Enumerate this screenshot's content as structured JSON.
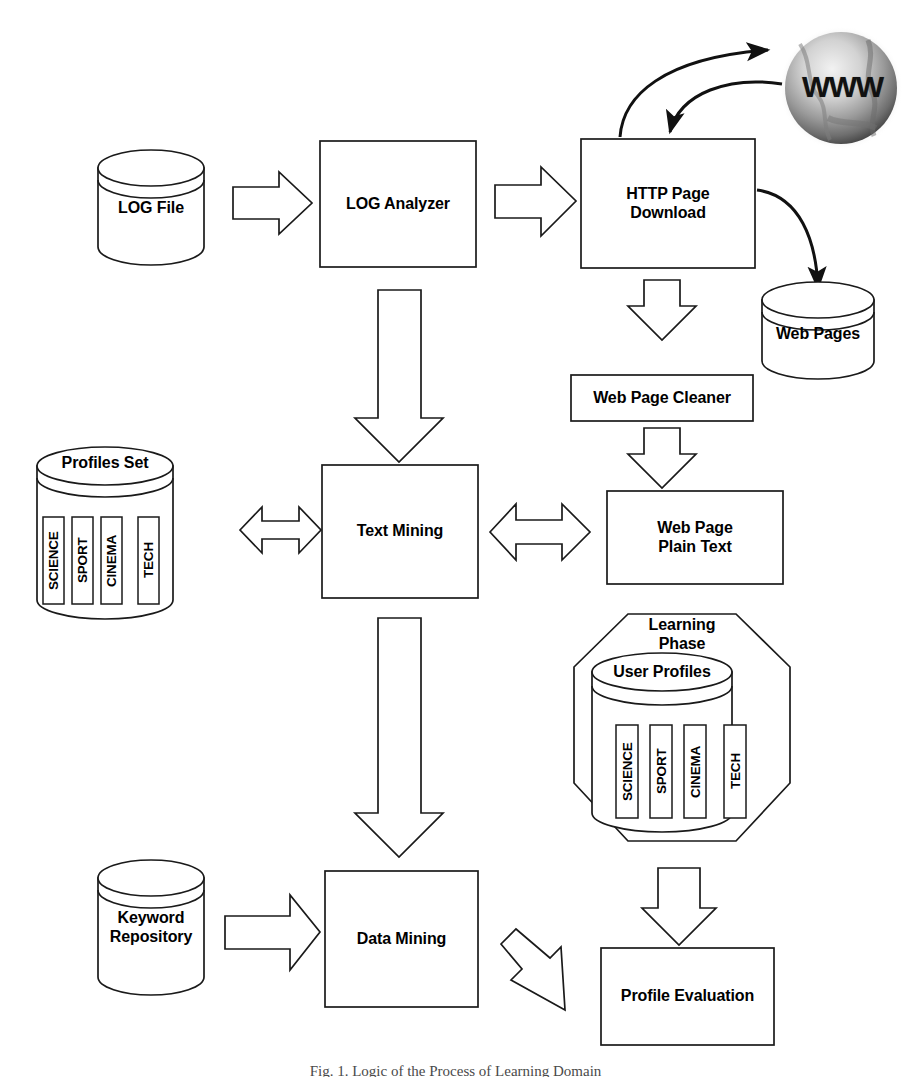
{
  "figure": {
    "caption": "Fig. 1. Logic of the Process of Learning Domain"
  },
  "nodes": {
    "log_file": {
      "label": "LOG File",
      "shape": "cylinder"
    },
    "log_analyzer": {
      "label": "LOG Analyzer",
      "shape": "rectangle"
    },
    "http_page_download": {
      "label": "HTTP Page\nDownload",
      "shape": "rectangle"
    },
    "www_globe": {
      "label": "WWW",
      "shape": "globe"
    },
    "web_pages": {
      "label": "Web Pages",
      "shape": "cylinder"
    },
    "web_page_cleaner": {
      "label": "Web Page Cleaner",
      "shape": "rectangle"
    },
    "web_page_plain_text": {
      "label": "Web Page\nPlain Text",
      "shape": "rectangle"
    },
    "text_mining": {
      "label": "Text  Mining",
      "shape": "rectangle"
    },
    "profiles_set": {
      "label": "Profiles Set",
      "shape": "cylinder-tabs"
    },
    "learning_phase": {
      "label": "Learning\nPhase",
      "shape": "octagon"
    },
    "user_profiles": {
      "label": "User Profiles",
      "shape": "cylinder-tabs"
    },
    "keyword_repository": {
      "label": "Keyword\nRepository",
      "shape": "cylinder"
    },
    "data_mining": {
      "label": "Data Mining",
      "shape": "rectangle"
    },
    "profile_evaluation": {
      "label": "Profile Evaluation",
      "shape": "rectangle"
    }
  },
  "profile_categories": [
    "SCIENCE",
    "SPORT",
    "CINEMA",
    "TECH"
  ],
  "user_profile_categories": [
    "SCIENCE",
    "SPORT",
    "CINEMA",
    "TECH"
  ],
  "connectors": [
    {
      "id": "log-file-to-log-analyzer",
      "kind": "block-arrow",
      "direction": "right"
    },
    {
      "id": "log-analyzer-to-http-page-download",
      "kind": "block-arrow",
      "direction": "right"
    },
    {
      "id": "http-page-download-to-www",
      "kind": "curved-arrow",
      "direction": "up-right"
    },
    {
      "id": "www-to-http-page-download",
      "kind": "curved-arrow",
      "direction": "down-left"
    },
    {
      "id": "http-page-download-to-web-pages",
      "kind": "curved-arrow",
      "direction": "down-right"
    },
    {
      "id": "http-page-download-to-web-page-cleaner",
      "kind": "block-arrow",
      "direction": "down"
    },
    {
      "id": "web-page-cleaner-to-web-page-plain-text",
      "kind": "block-arrow",
      "direction": "down"
    },
    {
      "id": "log-analyzer-to-text-mining",
      "kind": "block-arrow",
      "direction": "down"
    },
    {
      "id": "text-mining-to-profiles-set",
      "kind": "block-arrow",
      "direction": "bidirectional"
    },
    {
      "id": "text-mining-to-web-page-plain-text",
      "kind": "block-arrow",
      "direction": "bidirectional"
    },
    {
      "id": "text-mining-to-data-mining",
      "kind": "block-arrow",
      "direction": "down"
    },
    {
      "id": "keyword-repository-to-data-mining",
      "kind": "block-arrow",
      "direction": "right"
    },
    {
      "id": "data-mining-to-profile-evaluation",
      "kind": "block-arrow",
      "direction": "down-right"
    },
    {
      "id": "learning-phase-to-profile-evaluation",
      "kind": "block-arrow",
      "direction": "down"
    }
  ],
  "style": {
    "stroke": "#1a1a1a",
    "fill": "#ffffff",
    "text": "#000000",
    "globe_light": "#e8e8e8",
    "globe_dark": "#5a5a5a"
  }
}
